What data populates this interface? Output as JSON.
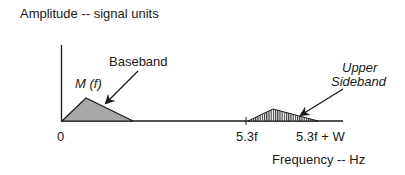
{
  "diagram": {
    "y_axis_label": "Amplitude -- signal units",
    "x_axis_label": "Frequency -- Hz",
    "baseband": {
      "label": "Baseband",
      "function_label": "M (f)",
      "fill": "#a8a8a8"
    },
    "upper_sideband": {
      "label_line1": "Upper",
      "label_line2": "Sideband",
      "fill_pattern": "vertical-hatch"
    },
    "ticks": {
      "origin": "0",
      "carrier": "5.3f",
      "carrier_plus_w": "5.3f + W"
    },
    "colors": {
      "line": "#1a1a1a",
      "baseband_fill": "#a8a8a8",
      "background": "#ffffff"
    }
  }
}
